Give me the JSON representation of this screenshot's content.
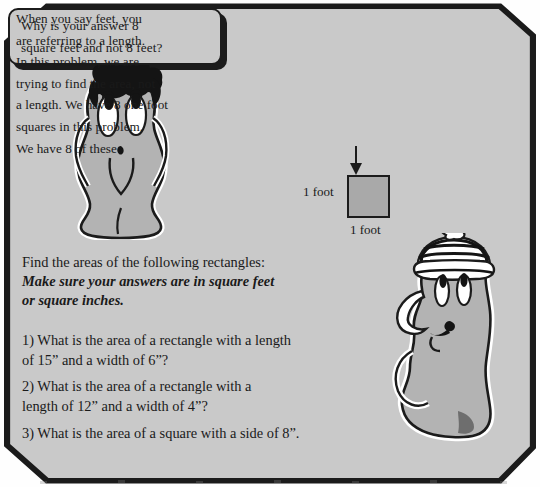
{
  "document": {
    "type": "math-worksheet-scan",
    "background_color": "#fefefe",
    "ink_color": "#1b1b1b",
    "bubble_fill": "#c9c9c9",
    "square_fill": "#a9a9a9"
  },
  "bubble_left": {
    "name": "question-speech-bubble",
    "line1": "Why is your answer 8",
    "line2": "square feet and not 8 feet?",
    "full_text": "Why is your answer 8 square feet and not 8 feet?"
  },
  "bubble_right": {
    "name": "answer-speech-bubble",
    "lines": [
      "When you say feet, you",
      "are referring to a length.",
      "In this problem, we are",
      "trying to find the area, not",
      "a length. We have 8 one foot",
      "squares in this problem.",
      "We have 8 of these"
    ],
    "full_text": "When you say feet, you are referring to a length. In this problem, we are trying to find the area, not a length. We have 8 one foot squares in this problem. We have 8 of these",
    "diagram": {
      "arrow_icon": "down-arrow-icon",
      "square_label_left": "1 foot",
      "square_label_bottom": "1 foot"
    }
  },
  "characters": [
    {
      "name": "blob-character-left",
      "description": "gray blob creature with black hair and large oval eyes"
    },
    {
      "name": "blob-character-right",
      "description": "gray blob creature wearing a striped beanie with pom-pom, arm on hip"
    }
  ],
  "worksheet": {
    "instruction": "Find the areas of the following rectangles:",
    "emphasis_line1": "Make sure your answers are in square feet",
    "emphasis_line2": "or square inches.",
    "emphasis_full": "Make sure your answers are in square feet or square inches.",
    "questions": [
      {
        "number": "1)",
        "line1": "1) What is the area of a rectangle with a length",
        "line2": "of 15” and a width of 6”?",
        "full_text": "1) What is the area of a rectangle with a length of 15” and a width of 6”?"
      },
      {
        "number": "2)",
        "line1": "2) What is the area of a rectangle with a",
        "line2": "length of 12” and a width of 4”?",
        "full_text": "2) What is the area of a rectangle with a length of 12” and a width of 4”?"
      },
      {
        "number": "3)",
        "line1": "3) What is the area of a square with a side of 8”.",
        "line2": "",
        "full_text": "3) What is the area of a square with a side of 8”."
      }
    ]
  }
}
